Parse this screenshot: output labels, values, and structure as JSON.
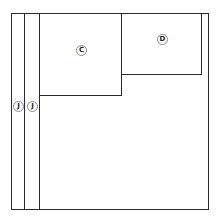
{
  "diagram": {
    "title": "",
    "panels": [
      {
        "id": "outer",
        "label": ""
      },
      {
        "id": "C",
        "label": "C"
      },
      {
        "id": "D",
        "label": "D"
      },
      {
        "id": "J1",
        "label": "J"
      },
      {
        "id": "J2",
        "label": "J"
      }
    ],
    "labels": {
      "c": "C",
      "d": "D",
      "j1": "J",
      "j2": "J"
    },
    "colors": {
      "line": "#2a2a2a",
      "label_ring": "#8a8a8a",
      "background": "#ffffff"
    }
  }
}
